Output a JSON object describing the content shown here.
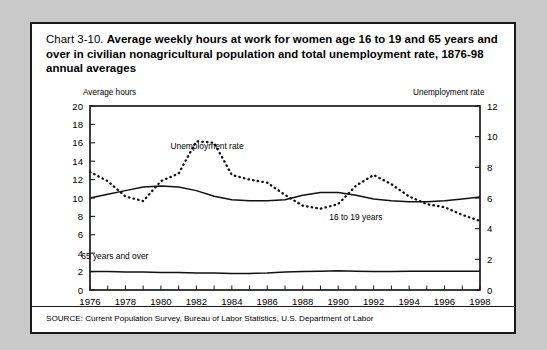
{
  "figure": {
    "title_prefix": "Chart 3-10.",
    "title_main": "Average weekly hours at work for women age 16 to 19 and 65 years and over in civilian nonagricultural population and total unemployment rate, 1876-98 annual averages",
    "source": "SOURCE: Current Population Survey, Bureau of Labor Statistics, U.S. Department of Labor",
    "left_axis_title": "Average hours",
    "right_axis_title": "Unemployment rate"
  },
  "chart_data": {
    "type": "line",
    "title": "Chart 3-10. Average weekly hours at work for women age 16 to 19 and 65 years and over in civilian nonagricultural population and total unemployment rate, 1876-98 annual averages",
    "xlabel": "",
    "ylabel": "Average hours",
    "y2label": "Unemployment rate",
    "xlim": [
      1976,
      1998
    ],
    "ylim": [
      0,
      20
    ],
    "y2lim": [
      0,
      12
    ],
    "grid": false,
    "legend": "inline-annotations",
    "x": [
      1976,
      1977,
      1978,
      1979,
      1980,
      1981,
      1982,
      1983,
      1984,
      1985,
      1986,
      1987,
      1988,
      1989,
      1990,
      1991,
      1992,
      1993,
      1994,
      1995,
      1996,
      1997,
      1998
    ],
    "xticks": [
      1976,
      1978,
      1980,
      1982,
      1984,
      1986,
      1988,
      1990,
      1992,
      1994,
      1996,
      1998
    ],
    "yticks": [
      0,
      2,
      4,
      6,
      8,
      10,
      12,
      14,
      16,
      18,
      20
    ],
    "y2ticks": [
      0,
      2,
      4,
      6,
      8,
      10,
      12
    ],
    "series": [
      {
        "name": "16 to 19 years",
        "axis": "left",
        "style": "solid",
        "units": "average weekly hours",
        "values": [
          10.0,
          10.4,
          10.8,
          11.2,
          11.3,
          11.2,
          10.8,
          10.2,
          9.8,
          9.7,
          9.7,
          9.8,
          10.3,
          10.6,
          10.6,
          10.3,
          9.9,
          9.7,
          9.6,
          9.6,
          9.7,
          9.9,
          10.1
        ]
      },
      {
        "name": "65 years and over",
        "axis": "left",
        "style": "solid",
        "units": "average weekly hours",
        "values": [
          2.0,
          2.0,
          1.95,
          1.95,
          1.9,
          1.9,
          1.85,
          1.85,
          1.8,
          1.8,
          1.85,
          1.95,
          2.0,
          2.05,
          2.1,
          2.05,
          2.0,
          2.0,
          2.05,
          2.05,
          2.05,
          2.05,
          2.05
        ]
      },
      {
        "name": "Unemployment rate",
        "axis": "right",
        "style": "dotted",
        "units": "percent",
        "values": [
          7.7,
          7.1,
          6.1,
          5.8,
          7.1,
          7.6,
          9.7,
          9.6,
          7.5,
          7.2,
          7.0,
          6.2,
          5.5,
          5.3,
          5.6,
          6.8,
          7.5,
          6.9,
          6.1,
          5.6,
          5.4,
          4.9,
          4.5
        ]
      }
    ],
    "annotations": [
      {
        "text": "Unemployment rate",
        "x": 1982.6,
        "y": 9.2,
        "axis": "right"
      },
      {
        "text": "16 to 19 years",
        "x": 1991.0,
        "y": 7.6,
        "axis": "left"
      },
      {
        "text": "65 years and over",
        "x": 1977.4,
        "y": 3.4,
        "axis": "left"
      }
    ]
  }
}
